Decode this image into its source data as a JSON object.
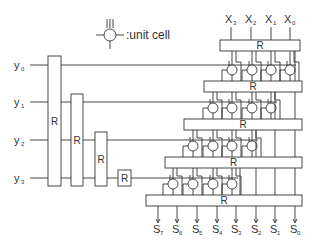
{
  "legend": {
    "label": ":unit cell",
    "icon": "unit-cell-icon"
  },
  "register_label": "R",
  "inputs_y": [
    {
      "label": "y",
      "sub": "0",
      "y": 65
    },
    {
      "label": "y",
      "sub": "1",
      "y": 102
    },
    {
      "label": "y",
      "sub": "2",
      "y": 140
    },
    {
      "label": "y",
      "sub": "3",
      "y": 178
    }
  ],
  "inputs_x": [
    {
      "label": "X",
      "sub": "3",
      "x": 231
    },
    {
      "label": "X",
      "sub": "2",
      "x": 251
    },
    {
      "label": "X",
      "sub": "1",
      "x": 271
    },
    {
      "label": "X",
      "sub": "0",
      "x": 290
    }
  ],
  "outputs_s": [
    {
      "label": "S",
      "sub": "7",
      "x": 158
    },
    {
      "label": "S",
      "sub": "6",
      "x": 177
    },
    {
      "label": "S",
      "sub": "5",
      "x": 197
    },
    {
      "label": "S",
      "sub": "4",
      "x": 217
    },
    {
      "label": "S",
      "sub": "3",
      "x": 236
    },
    {
      "label": "S",
      "sub": "2",
      "x": 256
    },
    {
      "label": "S",
      "sub": "1",
      "x": 275
    },
    {
      "label": "S",
      "sub": "0",
      "x": 295
    }
  ],
  "left_registers": [
    {
      "x": 48,
      "y": 56,
      "w": 13,
      "h": 130
    },
    {
      "x": 71,
      "y": 94,
      "w": 12,
      "h": 92
    },
    {
      "x": 95,
      "y": 132,
      "w": 12,
      "h": 54
    },
    {
      "x": 118,
      "y": 170,
      "w": 13,
      "h": 16
    }
  ],
  "row_registers": [
    {
      "x": 220,
      "y": 40,
      "w": 80,
      "h": 11
    },
    {
      "x": 204,
      "y": 81,
      "w": 98,
      "h": 11
    },
    {
      "x": 184,
      "y": 119,
      "w": 118,
      "h": 11
    },
    {
      "x": 165,
      "y": 157,
      "w": 137,
      "h": 11
    },
    {
      "x": 146,
      "y": 195,
      "w": 156,
      "h": 11
    }
  ],
  "cell_rows": [
    {
      "cy": 70,
      "xs": [
        232,
        252,
        271,
        290
      ]
    },
    {
      "cy": 108,
      "xs": [
        213,
        232,
        252,
        271
      ]
    },
    {
      "cy": 146,
      "xs": [
        193,
        213,
        232,
        252
      ]
    },
    {
      "cy": 184,
      "xs": [
        173,
        193,
        213,
        232
      ]
    }
  ]
}
